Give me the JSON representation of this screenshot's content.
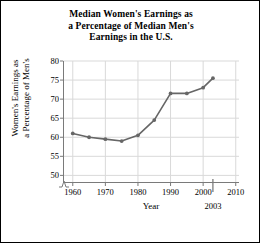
{
  "chart_data": {
    "type": "line",
    "title": "Median Women's Earnings as a Percentage of Median Men's Earnings in the U.S.",
    "title_lines": [
      "Median Women's Earnings as",
      "a Percentage of Median Men's",
      "Earnings in the U.S."
    ],
    "xlabel": "Year",
    "ylabel": "Women's Earnings as a Percentage of Men's",
    "ylabel_lines": [
      "Women's Earnings as",
      "a Percentage of Men's"
    ],
    "x": [
      1960,
      1965,
      1970,
      1975,
      1980,
      1985,
      1990,
      1995,
      2000,
      2003
    ],
    "values": [
      61,
      60,
      59.5,
      59,
      60.5,
      64.5,
      71.5,
      71.5,
      73,
      75.5
    ],
    "xlim": [
      1957,
      2011
    ],
    "ylim": [
      48,
      80
    ],
    "xticks": [
      1960,
      1970,
      1980,
      1990,
      2000,
      2010
    ],
    "xtick_labels": [
      "1960",
      "1970",
      "1980",
      "1990",
      "2000",
      "2010"
    ],
    "yticks": [
      50,
      55,
      60,
      65,
      70,
      75,
      80
    ],
    "ytick_labels": [
      "50",
      "55",
      "60",
      "65",
      "70",
      "75",
      "80"
    ],
    "special_xtick": {
      "value": 2003,
      "label": "2003"
    },
    "grid": true,
    "axis_break_y": true,
    "legend": null,
    "series_color": "#666666",
    "grid_color": "#d9d9d9",
    "axis_color": "#7a7a7a",
    "marker": "circle"
  }
}
